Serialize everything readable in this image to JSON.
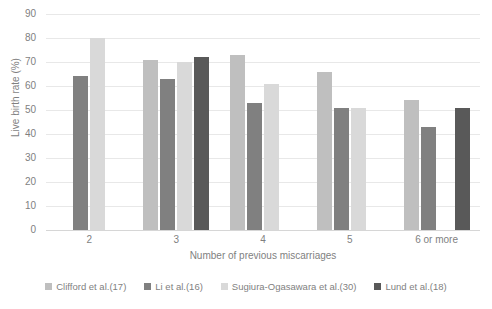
{
  "chart_data": {
    "type": "bar",
    "title": "",
    "subtitle": "",
    "xlabel": "Number of previous miscarriages",
    "ylabel": "Live birth rate (%)",
    "ylim": [
      0,
      90
    ],
    "ytick_step": 10,
    "yticks": [
      "90",
      "80",
      "70",
      "60",
      "50",
      "40",
      "30",
      "20",
      "10",
      "0"
    ],
    "grid": true,
    "legend_position": "bottom",
    "categories": [
      "2",
      "3",
      "4",
      "5",
      "6 or more"
    ],
    "series": [
      {
        "name": "Clifford et al.(17)",
        "color": "#bfbfbf",
        "values": [
          null,
          71,
          73,
          66,
          54
        ]
      },
      {
        "name": "Li et al.(16)",
        "color": "#808080",
        "values": [
          64,
          63,
          53,
          51,
          43
        ]
      },
      {
        "name": "Sugiura-Ogasawara et al.(30)",
        "color": "#d9d9d9",
        "values": [
          80,
          70,
          61,
          51,
          null
        ]
      },
      {
        "name": "Lund et al.(18)",
        "color": "#595959",
        "values": [
          null,
          72,
          null,
          null,
          51
        ]
      }
    ]
  },
  "axes": {
    "y_title": "Live birth rate (%)",
    "x_title": "Number of previous miscarriages"
  },
  "legend": {
    "items": [
      {
        "label": "Clifford et al.(17)",
        "color": "#bfbfbf"
      },
      {
        "label": "Li et al.(16)",
        "color": "#808080"
      },
      {
        "label": "Sugiura-Ogasawara et al.(30)",
        "color": "#d9d9d9"
      },
      {
        "label": "Lund et al.(18)",
        "color": "#595959"
      }
    ]
  },
  "colors": {
    "grid": "#e8e8e8",
    "axis_text": "#7f7f7f",
    "background": "#ffffff"
  }
}
